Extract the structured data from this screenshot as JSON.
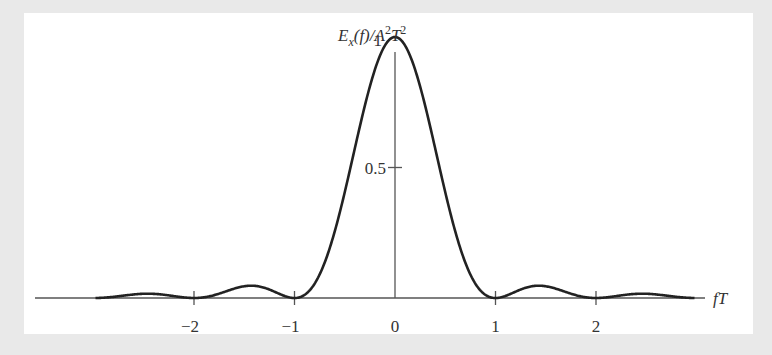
{
  "chart_data": {
    "type": "line",
    "title": "",
    "ylabel": "E_x(f)/A^2T^2",
    "xlabel": "fT",
    "x_ticks": [
      -2,
      -1,
      0,
      1,
      2
    ],
    "x_tick_labels": [
      "−2",
      "−1",
      "0",
      "1",
      "2"
    ],
    "y_ticks": [
      0.5,
      1
    ],
    "y_tick_labels": [
      "0.5",
      "1"
    ],
    "xlim": [
      -3,
      3
    ],
    "ylim": [
      0,
      1.15
    ],
    "grid": false,
    "legend": null,
    "function": "sinc^2(fT) = (sin(pi fT)/(pi fT))^2",
    "series": [
      {
        "name": "E_x(f)/A^2T^2",
        "x": [
          -3,
          -2.5,
          -2,
          -1.5,
          -1,
          -0.5,
          0,
          0.5,
          1,
          1.5,
          2,
          2.5,
          3
        ],
        "values": [
          0,
          0.016,
          0,
          0.045,
          0,
          0.405,
          1,
          0.405,
          0,
          0.045,
          0,
          0.016,
          0
        ]
      }
    ]
  },
  "labels": {
    "y_axis": "E",
    "y_axis_sub": "x",
    "y_axis_rest": "(f)/A",
    "y_axis_sup1": "2",
    "y_axis_T": "T",
    "y_axis_sup2": "2",
    "x_axis": "fT"
  },
  "colors": {
    "curve": "#222222",
    "axis": "#555555",
    "background": "#e9e9e9",
    "panel": "#ffffff"
  }
}
